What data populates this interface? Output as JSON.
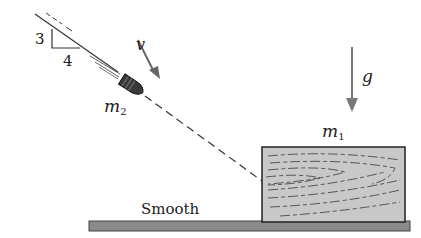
{
  "diagram": {
    "slope": {
      "rise": "3",
      "run": "4"
    },
    "velocity_label": "v",
    "gravity_label": "g",
    "bullet": {
      "mass_symbol": "m",
      "mass_subscript": "2"
    },
    "block": {
      "mass_symbol": "m",
      "mass_subscript": "1"
    },
    "surface_label": "Smooth",
    "colors": {
      "ink": "#222222",
      "arrow": "#666666",
      "block_fill": "#c8c8c8",
      "ground_fill": "#8a8a8a",
      "bullet_fill": "#3a3a3a"
    }
  }
}
